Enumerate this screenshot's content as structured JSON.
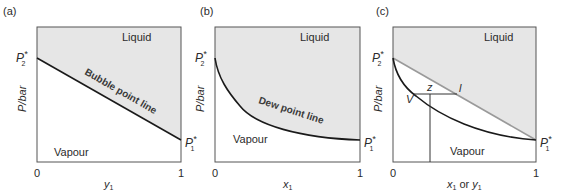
{
  "colors": {
    "liquid_fill": "#e6e6e6",
    "frame": "#555555",
    "curve": "#1a1a1a",
    "bubble_line_panel_c": "#9a9a9a",
    "text": "#2b2b2b"
  },
  "panels": [
    {
      "id": "a",
      "label": "(a)",
      "y_axis_label": "P/bar",
      "x_axis_label": "y",
      "x_axis_subscript": "1",
      "x_ticks": [
        "0",
        "1"
      ],
      "left_pressure": {
        "symbol": "P",
        "star": "*",
        "subscript": "2"
      },
      "right_pressure": {
        "symbol": "P",
        "star": "*",
        "subscript": "1"
      },
      "regions": {
        "upper": "Liquid",
        "lower": "Vapour"
      },
      "curve_label": "Bubble point line",
      "curve_type": "linear"
    },
    {
      "id": "b",
      "label": "(b)",
      "y_axis_label": "P/bar",
      "x_axis_label": "x",
      "x_axis_subscript": "1",
      "x_ticks": [
        "0",
        "1"
      ],
      "left_pressure": {
        "symbol": "P",
        "star": "*",
        "subscript": "2"
      },
      "right_pressure": {
        "symbol": "P",
        "star": "*",
        "subscript": "1"
      },
      "regions": {
        "upper": "Liquid",
        "lower": "Vapour"
      },
      "curve_label": "Dew point line",
      "curve_type": "convex"
    },
    {
      "id": "c",
      "label": "(c)",
      "y_axis_label": "P/bar",
      "x_axis_label_parts": [
        "x",
        "1",
        " or ",
        "y",
        "1"
      ],
      "x_ticks": [
        "0",
        "1"
      ],
      "left_pressure": {
        "symbol": "P",
        "star": "*",
        "subscript": "2"
      },
      "right_pressure": {
        "symbol": "P",
        "star": "*",
        "subscript": "1"
      },
      "regions": {
        "upper": "Liquid",
        "lower": "Vapour"
      },
      "tie_line_labels": {
        "vapour_point": "V",
        "overall": "z",
        "liquid_point": "l"
      },
      "curve_type": "both"
    }
  ]
}
